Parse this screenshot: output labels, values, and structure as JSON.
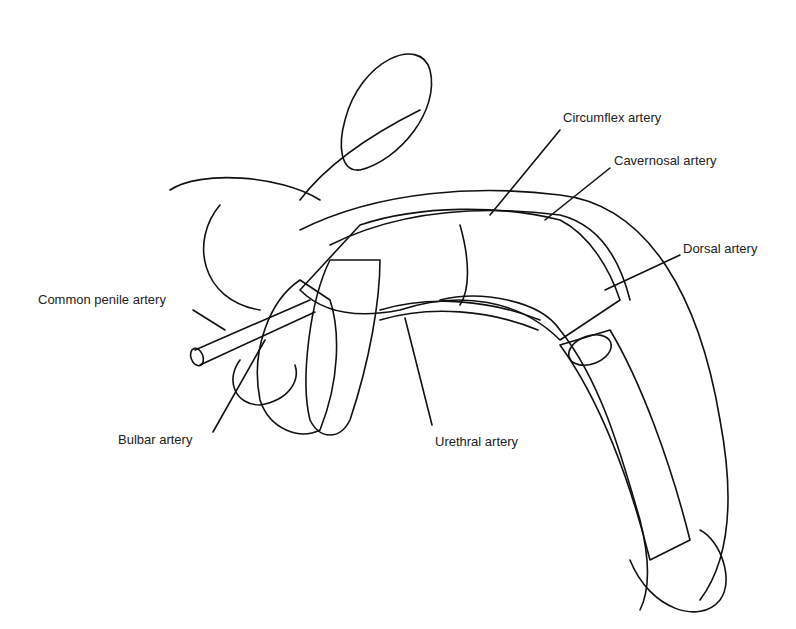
{
  "figure": {
    "labels": {
      "circumflex": "Circumflex artery",
      "cavernosal": "Cavernosal artery",
      "dorsal": "Dorsal artery",
      "common_penile": "Common penile artery",
      "bulbar": "Bulbar artery",
      "urethral": "Urethral artery"
    }
  }
}
